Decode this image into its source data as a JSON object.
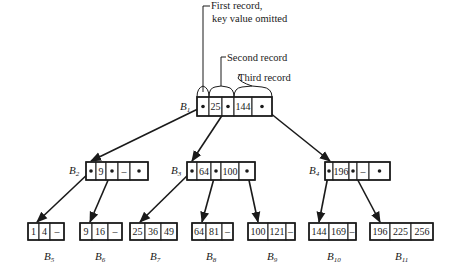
{
  "annotations": {
    "first": [
      "First record,",
      "key value omitted"
    ],
    "second": "Second record",
    "third": "Third record"
  },
  "nodes": {
    "B1": {
      "label": "B",
      "sub": "1",
      "cells": [
        "•",
        "25",
        "•",
        "144",
        "•"
      ]
    },
    "B2": {
      "label": "B",
      "sub": "2",
      "cells": [
        "•",
        "9",
        "•",
        "–",
        "•"
      ]
    },
    "B3": {
      "label": "B",
      "sub": "3",
      "cells": [
        "•",
        "64",
        "•",
        "100",
        "•"
      ]
    },
    "B4": {
      "label": "B",
      "sub": "4",
      "cells": [
        "•",
        "196",
        "•",
        "–",
        "•"
      ]
    },
    "B5": {
      "label": "B",
      "sub": "5",
      "cells": [
        "1",
        "4",
        "–"
      ]
    },
    "B6": {
      "label": "B",
      "sub": "6",
      "cells": [
        "9",
        "16",
        "–"
      ]
    },
    "B7": {
      "label": "B",
      "sub": "7",
      "cells": [
        "25",
        "36",
        "49"
      ]
    },
    "B8": {
      "label": "B",
      "sub": "8",
      "cells": [
        "64",
        "81",
        "–"
      ]
    },
    "B9": {
      "label": "B",
      "sub": "9",
      "cells": [
        "100",
        "121",
        "–"
      ]
    },
    "B10": {
      "label": "B",
      "sub": "10",
      "cells": [
        "144",
        "169",
        "–"
      ]
    },
    "B11": {
      "label": "B",
      "sub": "11",
      "cells": [
        "196",
        "225",
        "256"
      ]
    }
  },
  "edges": [
    [
      "B1",
      0,
      "B2"
    ],
    [
      "B1",
      2,
      "B3"
    ],
    [
      "B1",
      4,
      "B4"
    ],
    [
      "B2",
      0,
      "B5"
    ],
    [
      "B2",
      2,
      "B6"
    ],
    [
      "B3",
      0,
      "B7"
    ],
    [
      "B3",
      2,
      "B8"
    ],
    [
      "B3",
      4,
      "B9"
    ],
    [
      "B4",
      0,
      "B10"
    ],
    [
      "B4",
      2,
      "B11"
    ]
  ]
}
